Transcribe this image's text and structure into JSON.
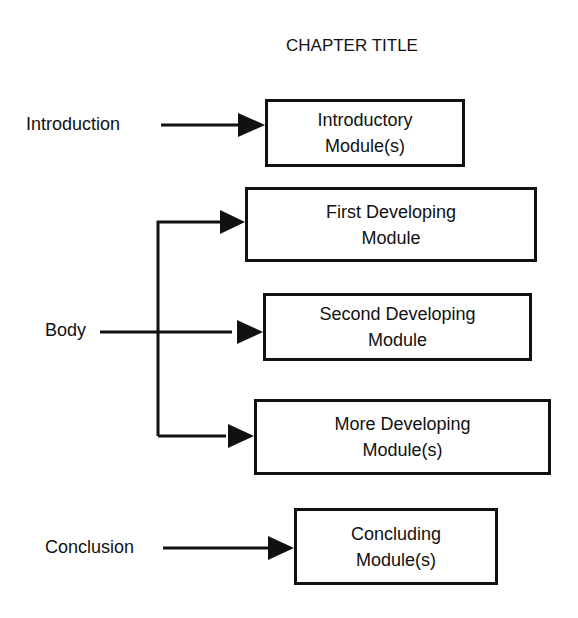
{
  "title": "CHAPTER TITLE",
  "sections": {
    "introduction": {
      "label": "Introduction"
    },
    "body": {
      "label": "Body"
    },
    "conclusion": {
      "label": "Conclusion"
    }
  },
  "modules": [
    {
      "line1": "Introductory",
      "line2": "Module(s)"
    },
    {
      "line1": "First Developing",
      "line2": "Module"
    },
    {
      "line1": "Second Developing",
      "line2": "Module"
    },
    {
      "line1": "More Developing",
      "line2": "Module(s)"
    },
    {
      "line1": "Concluding",
      "line2": "Module(s)"
    }
  ],
  "colors": {
    "ink": "#111111",
    "background": "#ffffff"
  }
}
